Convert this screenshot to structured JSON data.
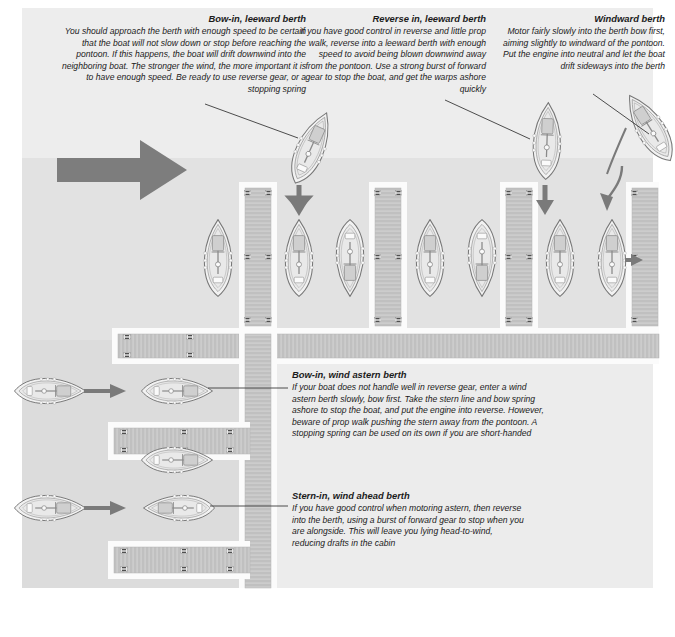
{
  "diagram": {
    "water_color": "#dcdcdc",
    "light_water_color": "#ededed",
    "pontoon_color": "#c9c9c9",
    "pontoon_edge_color": "#fbfbfb",
    "boat_fill": "#f0f0f0",
    "boat_stroke": "#7b7b7b",
    "arrow_color": "#7a7a7a",
    "wind_arrow_color": "#6f6f6f",
    "leader_color": "#3a3a3a",
    "text_color": "#1b1b1b"
  },
  "captions": [
    {
      "id": "bow-in-leeward",
      "heading": "Bow-in, leeward berth",
      "body": "You should approach the berth with enough speed to be certain that the boat will not slow down or stop before reaching the pontoon. If this happens, the boat will drift downwind into the neighboring boat. The stronger the wind, the more important it is to have enough speed. Be ready to use reverse gear, or a stopping spring",
      "align": "right"
    },
    {
      "id": "reverse-in-leeward",
      "heading": "Reverse in, leeward berth",
      "body": "If you have good control in reverse and little prop walk, reverse into a leeward berth with enough speed to avoid being blown downwind away from the pontoon. Use a strong burst of forward gear to stop the boat, and get the warps ashore quickly",
      "align": "right"
    },
    {
      "id": "windward-berth",
      "heading": "Windward berth",
      "body": "Motor fairly slowly into the berth bow first, aiming slightly to windward of the pontoon. Put the engine into neutral and let the boat drift sideways into the berth",
      "align": "right"
    },
    {
      "id": "bow-in-wind-astern",
      "heading": "Bow-in, wind astern berth",
      "body": "If your boat does not handle well in reverse gear, enter a wind astern berth slowly, bow first. Take the stern line and bow spring ashore to stop the boat, and put the engine into reverse. However, beware of prop walk pushing the stern away from the pontoon. A stopping spring can be used on its own if you are short-handed",
      "align": "left"
    },
    {
      "id": "stern-in-wind-ahead",
      "heading": "Stern-in, wind ahead berth",
      "body": "If you have good control when motoring astern, then reverse into the berth, using a burst of forward gear to stop when you are alongside. This will leave you lying head-to-wind, reducing drafts in the cabin",
      "align": "left"
    }
  ],
  "icons": {
    "wind_arrow": "wind-direction-arrow",
    "approach_arrow": "boat-approach-arrow",
    "curved_arrow": "curved-approach-arrow",
    "cleat": "pontoon-cleat",
    "boat": "sailing-yacht-plan-view"
  }
}
